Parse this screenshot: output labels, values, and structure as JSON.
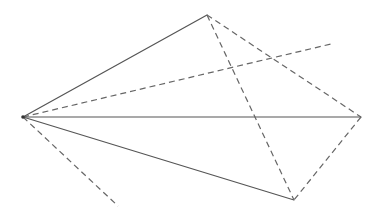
{
  "diagram": {
    "type": "geometric-figure",
    "stroke_color": "#555555",
    "dash_color": "#666666",
    "points": {
      "A": [
        23,
        117
      ],
      "B": [
        207,
        15
      ],
      "C": [
        361,
        117
      ],
      "D": [
        294,
        200
      ],
      "E": [
        331,
        44
      ],
      "F": [
        118,
        206
      ]
    },
    "solid_segments": [
      [
        "A",
        "B"
      ],
      [
        "A",
        "C"
      ],
      [
        "A",
        "D"
      ]
    ],
    "dashed_segments": [
      [
        "B",
        "C"
      ],
      [
        "B",
        "D"
      ],
      [
        "C",
        "D"
      ],
      [
        "A",
        "E"
      ],
      [
        "A",
        "F"
      ]
    ]
  }
}
